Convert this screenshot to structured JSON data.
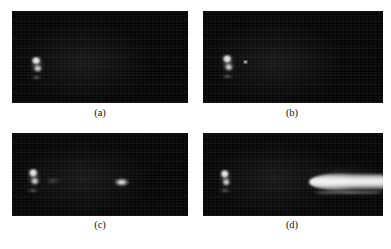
{
  "figure": {
    "background_color": "#ffffff",
    "panel_background_color": "#050505",
    "label_color": "#111111",
    "panels": [
      {
        "id": "panel-a",
        "label": "(a)",
        "position": {
          "x": 12,
          "y": 11,
          "width": 176,
          "height": 92
        },
        "label_position": {
          "x": 100,
          "y": 108
        },
        "features": [
          {
            "name": "source-blob",
            "x": 30,
            "y": 56,
            "width": 14,
            "height": 19,
            "brightness": "high"
          },
          {
            "name": "source-underline",
            "x": 30,
            "y": 76,
            "width": 13,
            "height": 3,
            "brightness": "medium"
          }
        ]
      },
      {
        "id": "panel-b",
        "label": "(b)",
        "position": {
          "x": 203,
          "y": 11,
          "width": 180,
          "height": 92
        },
        "label_position": {
          "x": 292,
          "y": 108
        },
        "features": [
          {
            "name": "source-blob",
            "x": 221,
            "y": 54,
            "width": 14,
            "height": 20,
            "brightness": "high"
          },
          {
            "name": "source-underline",
            "x": 221,
            "y": 75,
            "width": 13,
            "height": 3,
            "brightness": "medium"
          },
          {
            "name": "detached-speck",
            "x": 243,
            "y": 61,
            "width": 4,
            "height": 3,
            "brightness": "medium-high"
          }
        ]
      },
      {
        "id": "panel-c",
        "label": "(c)",
        "position": {
          "x": 12,
          "y": 133,
          "width": 176,
          "height": 83
        },
        "label_position": {
          "x": 100,
          "y": 220
        },
        "features": [
          {
            "name": "source-blob",
            "x": 27,
            "y": 168,
            "width": 14,
            "height": 20,
            "brightness": "high"
          },
          {
            "name": "source-underline",
            "x": 26,
            "y": 189,
            "width": 14,
            "height": 3,
            "brightness": "medium"
          },
          {
            "name": "faint-smear",
            "x": 46,
            "y": 177,
            "width": 17,
            "height": 7,
            "brightness": "low"
          },
          {
            "name": "detached-oval-blob",
            "x": 113,
            "y": 178,
            "width": 17,
            "height": 9,
            "brightness": "high"
          }
        ]
      },
      {
        "id": "panel-d",
        "label": "(d)",
        "position": {
          "x": 203,
          "y": 133,
          "width": 180,
          "height": 83
        },
        "label_position": {
          "x": 292,
          "y": 220
        },
        "features": [
          {
            "name": "source-blob",
            "x": 219,
            "y": 169,
            "width": 13,
            "height": 20,
            "brightness": "high"
          },
          {
            "name": "source-underline",
            "x": 218,
            "y": 189,
            "width": 14,
            "height": 3,
            "brightness": "medium"
          },
          {
            "name": "elongated-plume",
            "x": 309,
            "y": 173,
            "width": 74,
            "height": 18,
            "brightness": "very-high"
          },
          {
            "name": "plume-shadow-bar",
            "x": 313,
            "y": 191,
            "width": 70,
            "height": 3,
            "brightness": "low-medium"
          }
        ]
      }
    ]
  }
}
